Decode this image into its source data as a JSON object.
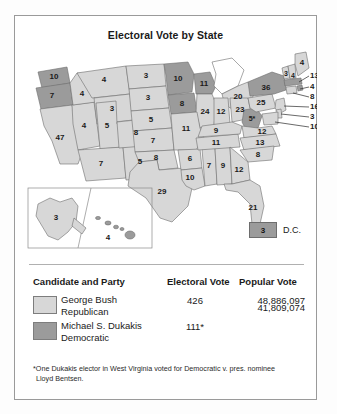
{
  "figure": {
    "title": "Electoral Vote by State"
  },
  "map": {
    "dc": {
      "value": "3",
      "label": "D.C."
    },
    "states": [
      {
        "name": "washington",
        "value": "10",
        "party": "dukakis"
      },
      {
        "name": "oregon",
        "value": "7",
        "party": "dukakis"
      },
      {
        "name": "california",
        "value": "47",
        "party": "bush"
      },
      {
        "name": "nevada",
        "value": "4",
        "party": "bush"
      },
      {
        "name": "idaho",
        "value": "4",
        "party": "bush"
      },
      {
        "name": "montana",
        "value": "4",
        "party": "bush"
      },
      {
        "name": "wyoming",
        "value": "3",
        "party": "bush"
      },
      {
        "name": "utah",
        "value": "5",
        "party": "bush"
      },
      {
        "name": "arizona",
        "value": "7",
        "party": "bush"
      },
      {
        "name": "new-mexico",
        "value": "5",
        "party": "bush"
      },
      {
        "name": "colorado",
        "value": "8",
        "party": "bush"
      },
      {
        "name": "north-dakota",
        "value": "3",
        "party": "bush"
      },
      {
        "name": "south-dakota",
        "value": "3",
        "party": "bush"
      },
      {
        "name": "nebraska",
        "value": "5",
        "party": "bush"
      },
      {
        "name": "kansas",
        "value": "7",
        "party": "bush"
      },
      {
        "name": "oklahoma",
        "value": "8",
        "party": "bush"
      },
      {
        "name": "texas",
        "value": "29",
        "party": "bush"
      },
      {
        "name": "minnesota",
        "value": "10",
        "party": "dukakis"
      },
      {
        "name": "iowa",
        "value": "8",
        "party": "dukakis"
      },
      {
        "name": "wisconsin",
        "value": "11",
        "party": "dukakis"
      },
      {
        "name": "michigan",
        "value": "20",
        "party": "bush"
      },
      {
        "name": "illinois",
        "value": "24",
        "party": "bush"
      },
      {
        "name": "indiana",
        "value": "12",
        "party": "bush"
      },
      {
        "name": "ohio",
        "value": "23",
        "party": "bush"
      },
      {
        "name": "missouri",
        "value": "11",
        "party": "bush"
      },
      {
        "name": "arkansas",
        "value": "6",
        "party": "bush"
      },
      {
        "name": "louisiana",
        "value": "10",
        "party": "bush"
      },
      {
        "name": "mississippi",
        "value": "7",
        "party": "bush"
      },
      {
        "name": "alabama",
        "value": "9",
        "party": "bush"
      },
      {
        "name": "tennessee",
        "value": "11",
        "party": "bush"
      },
      {
        "name": "kentucky",
        "value": "9",
        "party": "bush"
      },
      {
        "name": "west-virginia",
        "value": "5*",
        "party": "dukakis"
      },
      {
        "name": "virginia",
        "value": "12",
        "party": "bush"
      },
      {
        "name": "north-carolina",
        "value": "13",
        "party": "bush"
      },
      {
        "name": "south-carolina",
        "value": "8",
        "party": "bush"
      },
      {
        "name": "georgia",
        "value": "12",
        "party": "bush"
      },
      {
        "name": "florida",
        "value": "21",
        "party": "bush"
      },
      {
        "name": "pennsylvania",
        "value": "25",
        "party": "bush"
      },
      {
        "name": "new-york",
        "value": "36",
        "party": "dukakis"
      },
      {
        "name": "vermont",
        "value": "3",
        "party": "bush"
      },
      {
        "name": "new-hampshire",
        "value": "4",
        "party": "bush"
      },
      {
        "name": "maine",
        "value": "4",
        "party": "bush"
      },
      {
        "name": "alaska",
        "value": "3",
        "party": "bush"
      },
      {
        "name": "hawaii",
        "value": "4",
        "party": "dukakis"
      }
    ],
    "callouts": [
      {
        "name": "massachusetts",
        "value": "13",
        "party": "dukakis"
      },
      {
        "name": "rhode-island",
        "value": "4",
        "party": "dukakis"
      },
      {
        "name": "connecticut",
        "value": "8",
        "party": "bush"
      },
      {
        "name": "new-jersey",
        "value": "16",
        "party": "bush"
      },
      {
        "name": "delaware",
        "value": "3",
        "party": "bush"
      },
      {
        "name": "maryland",
        "value": "10",
        "party": "bush"
      }
    ]
  },
  "legend": {
    "headers": {
      "candidate": "Candidate and Party",
      "electoral": "Electoral Vote",
      "popular": "Popular Vote"
    },
    "rows": [
      {
        "candidate": "George Bush",
        "party": "Republican",
        "electoral": "426",
        "popular": "48,886,097",
        "swatch": "#d7d7d7"
      },
      {
        "candidate": "Michael S. Dukakis",
        "party": "Democratic",
        "electoral": "111*",
        "popular": "41,809,074",
        "swatch": "#9b9b9b"
      }
    ]
  },
  "footnote": {
    "line1": "*One Dukakis elector in West Virginia voted for Democratic v. pres. nominee",
    "line2": "Lloyd Bentsen."
  },
  "colors": {
    "bush_fill": "#d7d7d7",
    "dukakis_fill": "#9b9b9b",
    "outline": "#6d6d6d",
    "text": "#1a1a1a"
  }
}
